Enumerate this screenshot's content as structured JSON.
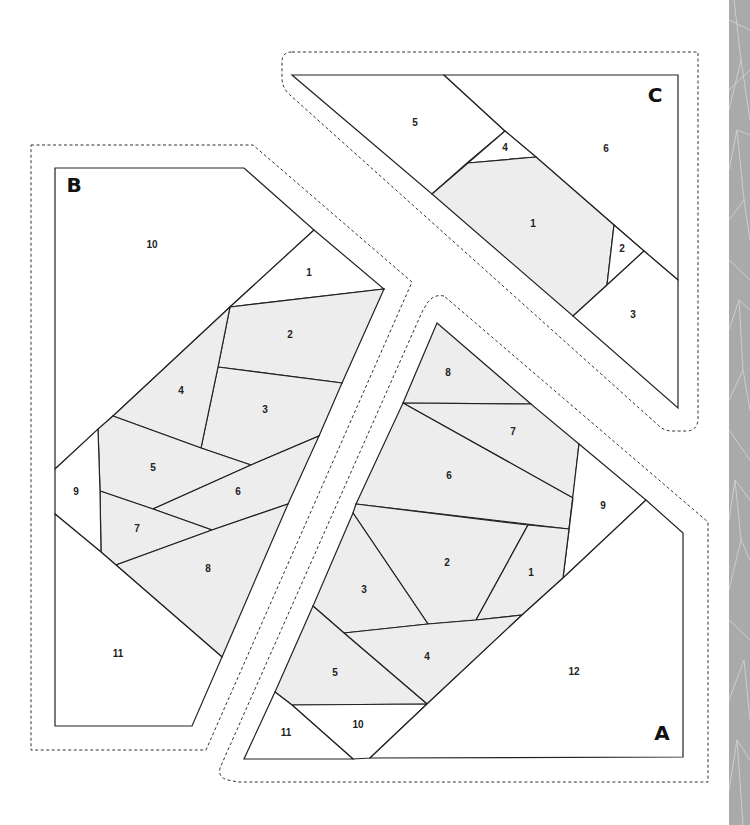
{
  "pattern": {
    "type": "foundation paper piecing template",
    "colors": {
      "background": "#ffffff",
      "shaded_piece": "#ededed",
      "line": "#222222",
      "side_strip": "#aaaaaa"
    },
    "sections": [
      {
        "label": "A",
        "pieces": [
          {
            "num": "1",
            "shaded": true
          },
          {
            "num": "2",
            "shaded": true
          },
          {
            "num": "3",
            "shaded": true
          },
          {
            "num": "4",
            "shaded": true
          },
          {
            "num": "5",
            "shaded": true
          },
          {
            "num": "6",
            "shaded": true
          },
          {
            "num": "7",
            "shaded": true
          },
          {
            "num": "8",
            "shaded": true
          },
          {
            "num": "9",
            "shaded": false
          },
          {
            "num": "10",
            "shaded": false
          },
          {
            "num": "11",
            "shaded": false
          },
          {
            "num": "12",
            "shaded": false
          }
        ]
      },
      {
        "label": "B",
        "pieces": [
          {
            "num": "1",
            "shaded": false
          },
          {
            "num": "2",
            "shaded": true
          },
          {
            "num": "3",
            "shaded": true
          },
          {
            "num": "4",
            "shaded": true
          },
          {
            "num": "5",
            "shaded": true
          },
          {
            "num": "6",
            "shaded": true
          },
          {
            "num": "7",
            "shaded": true
          },
          {
            "num": "8",
            "shaded": true
          },
          {
            "num": "9",
            "shaded": false
          },
          {
            "num": "10",
            "shaded": false
          },
          {
            "num": "11",
            "shaded": false
          }
        ]
      },
      {
        "label": "C",
        "pieces": [
          {
            "num": "1",
            "shaded": true
          },
          {
            "num": "2",
            "shaded": false
          },
          {
            "num": "3",
            "shaded": false
          },
          {
            "num": "4",
            "shaded": false
          },
          {
            "num": "5",
            "shaded": false
          },
          {
            "num": "6",
            "shaded": false
          }
        ]
      }
    ]
  }
}
